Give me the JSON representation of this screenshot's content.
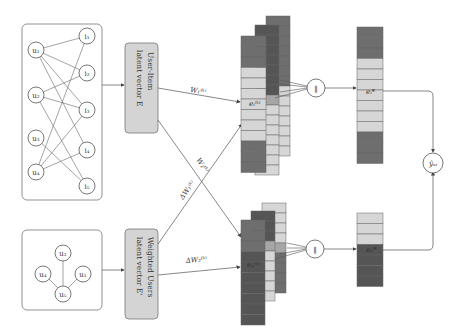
{
  "colors": {
    "cell_dark": "#6e6e6e",
    "cell_darker": "#555555",
    "cell_light": "#d6d6d6",
    "cell_mid": "#a6a6a6",
    "box_fill": "#d4d4d4",
    "line": "#555555"
  },
  "bipartite_graph": {
    "users": [
      "u1",
      "u2",
      "u3",
      "u4"
    ],
    "items": [
      "i1",
      "i2",
      "i3",
      "i4",
      "i5"
    ],
    "edges": [
      [
        "u1",
        "i1"
      ],
      [
        "u1",
        "i2"
      ],
      [
        "u1",
        "i3"
      ],
      [
        "u1",
        "i4"
      ],
      [
        "u2",
        "i2"
      ],
      [
        "u2",
        "i3"
      ],
      [
        "u2",
        "i5"
      ],
      [
        "u3",
        "i5"
      ],
      [
        "u4",
        "i1"
      ],
      [
        "u4",
        "i3"
      ],
      [
        "u4",
        "i4"
      ]
    ]
  },
  "social_graph": {
    "users": [
      "u2",
      "u4",
      "u1",
      "u5"
    ],
    "edges": [
      [
        "u2",
        "u5"
      ],
      [
        "u4",
        "u5"
      ],
      [
        "u1",
        "u5"
      ]
    ]
  },
  "boxes": {
    "user_item": {
      "line1": "User-Item",
      "line2": "latent vector E"
    },
    "weighted_users": {
      "line1": "Weighted Users",
      "line2": "latent vector E'"
    }
  },
  "edge_labels": {
    "w1": "W₁⁽ᵏ⁾",
    "w2": "W₂⁽ᵏ⁾",
    "dw1": "ΔW₁⁽ᵏ⁾",
    "dw2": "ΔW₂⁽ᵏ⁾"
  },
  "embeddings": {
    "top_cell_label": "eᵢ⁽ᵏ⁾",
    "bottom_cell_label": "eᵤ⁽ᵏ⁾",
    "top_output_label": "eᵢ*",
    "bottom_output_label": "eᵤ*",
    "top_pattern": [
      "d",
      "d",
      "d",
      "l",
      "l",
      "l",
      "l",
      "l",
      "l",
      "l",
      "d",
      "d",
      "d"
    ],
    "bottom_pattern": [
      "l",
      "l",
      "l",
      "D",
      "D",
      "D",
      "D"
    ]
  },
  "concat_symbol": "‖",
  "prediction_label": "ŷᵤᵢ"
}
